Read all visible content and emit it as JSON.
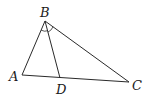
{
  "figure": {
    "type": "geometry-triangle",
    "points": {
      "A": {
        "label": "A",
        "x": 22,
        "y": 75
      },
      "B": {
        "label": "B",
        "x": 45,
        "y": 21
      },
      "C": {
        "label": "C",
        "x": 129,
        "y": 82
      },
      "D": {
        "label": "D",
        "x": 60,
        "y": 78
      }
    },
    "segments": [
      "AB",
      "BC",
      "AC",
      "BD"
    ],
    "angle_marks": [
      "ABD",
      "DBC"
    ],
    "labels": {
      "A": "A",
      "B": "B",
      "C": "C",
      "D": "D"
    }
  }
}
